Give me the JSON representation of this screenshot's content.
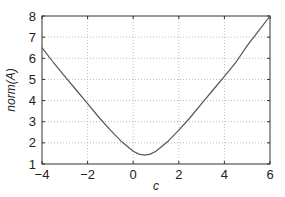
{
  "chart_data": {
    "type": "line",
    "title": "",
    "xlabel": "c",
    "ylabel": "norm(A)",
    "xlim": [
      -4,
      6
    ],
    "ylim": [
      1,
      8
    ],
    "grid": true,
    "legend": null,
    "xticks": [
      "-4",
      "-2",
      "0",
      "2",
      "4",
      "6"
    ],
    "yticks": [
      "1",
      "2",
      "3",
      "4",
      "5",
      "6",
      "7",
      "8"
    ],
    "series": [
      {
        "name": "norm(A)",
        "color": "#555555",
        "x": [
          -4,
          -3.5,
          -3,
          -2.5,
          -2,
          -1.5,
          -1,
          -0.5,
          0,
          0.25,
          0.5,
          0.75,
          1,
          1.5,
          2,
          2.5,
          3,
          3.5,
          4,
          4.5,
          5,
          5.5,
          6
        ],
        "y": [
          6.5,
          5.8,
          5.15,
          4.5,
          3.85,
          3.2,
          2.6,
          2.05,
          1.6,
          1.47,
          1.42,
          1.47,
          1.6,
          2.05,
          2.6,
          3.2,
          3.85,
          4.5,
          5.15,
          5.8,
          6.6,
          7.3,
          8.0
        ]
      }
    ]
  }
}
